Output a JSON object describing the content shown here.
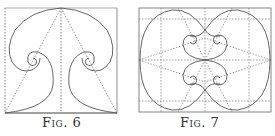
{
  "figures": [
    {
      "id": "fig6",
      "caption": "Fig. 6",
      "description": "Square with two mirrored spiral volutes, dotted center line and diagonals from top center to bottom corners"
    },
    {
      "id": "fig7",
      "caption": "Fig. 7",
      "description": "Rectangle with dotted 3x3 construction grid, diamond diagonals, outer ellipse and four mirrored spiral volutes"
    }
  ],
  "colors": {
    "line": "#555555",
    "dotted": "#777777",
    "background": "#ffffff"
  }
}
